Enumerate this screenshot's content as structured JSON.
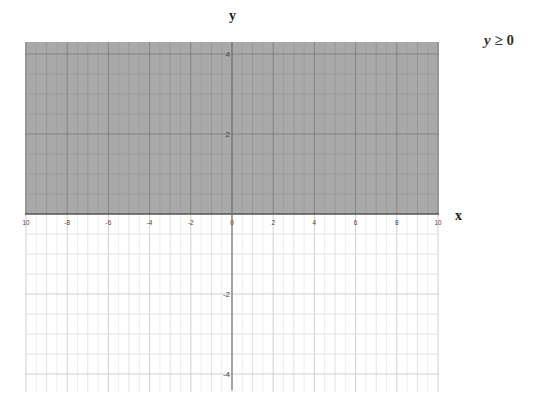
{
  "chart_data": {
    "type": "inequality-graph",
    "title": "",
    "inequality": "y ≥ 0",
    "inequality_parts": {
      "variable": "y",
      "operator": "≥",
      "value": "0"
    },
    "xlabel": "x",
    "ylabel": "y",
    "xlim": [
      -10,
      10
    ],
    "ylim": [
      -4.25,
      4.3
    ],
    "x_ticks": [
      -10,
      -8,
      -6,
      -4,
      -2,
      0,
      2,
      4,
      6,
      8,
      10
    ],
    "x_tick_labels": [
      "10",
      "-8",
      "-6",
      "-4",
      "-2",
      "0",
      "2",
      "4",
      "6",
      "8",
      "10"
    ],
    "y_ticks": [
      4,
      2,
      -2,
      -4
    ],
    "y_tick_labels": [
      "4",
      "2",
      "-2",
      "-4"
    ],
    "grid": true,
    "boundary": {
      "equation": "y = 0",
      "style": "solid"
    },
    "shaded_region": {
      "description": "y >= 0 (above x-axis)",
      "y_from": 0,
      "y_to": 4.3,
      "color": "#a9a9a9"
    }
  },
  "colors": {
    "shade": "#a9a9a9",
    "grid_minor": "#e2e2e2",
    "grid_major": "#cfcfcf",
    "axis": "#777777",
    "label": "#444444"
  }
}
